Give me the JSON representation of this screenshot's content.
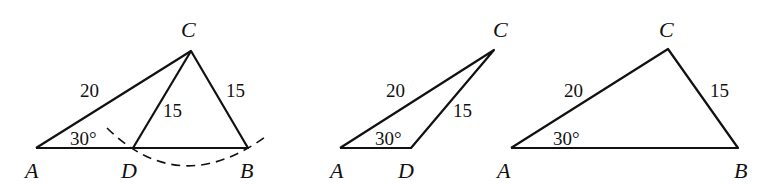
{
  "figures": [
    {
      "name": "figure-1",
      "points": {
        "A": "A",
        "C": "C",
        "D": "D",
        "B": "B"
      },
      "labels": {
        "AC": "20",
        "CD": "15",
        "CB": "15",
        "angle_A": "30°"
      }
    },
    {
      "name": "figure-2",
      "points": {
        "A": "A",
        "C": "C",
        "D": "D"
      },
      "labels": {
        "AC": "20",
        "CD": "15",
        "angle_A": "30°"
      }
    },
    {
      "name": "figure-3",
      "points": {
        "A": "A",
        "C": "C",
        "B": "B"
      },
      "labels": {
        "AC": "20",
        "CB": "15",
        "angle_A": "30°"
      }
    }
  ]
}
